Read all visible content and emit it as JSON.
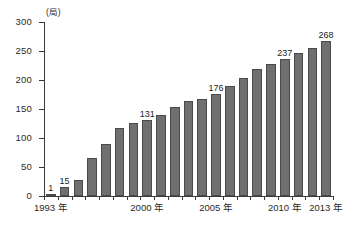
{
  "chart_data": {
    "type": "bar",
    "title": "",
    "subtitle": "",
    "xlabel": "",
    "ylabel": "(局)",
    "yunit": "(局)",
    "ylim": [
      0,
      300
    ],
    "ytick_labels": [
      "300",
      "250",
      "200",
      "150",
      "100",
      "50",
      "0"
    ],
    "ytick_values": [
      300,
      250,
      200,
      150,
      100,
      50,
      0
    ],
    "grid": false,
    "legend": null,
    "bar_color": "#6f6f6f",
    "bar_edge_color": "#4a4a4a",
    "axis_color": "#3a3a3a",
    "categories": [
      "1993",
      "1994",
      "1995",
      "1996",
      "1997",
      "1998",
      "1999",
      "2000",
      "2001",
      "2002",
      "2003",
      "2004",
      "2005",
      "2006",
      "2007",
      "2008",
      "2009",
      "2010",
      "2011",
      "2012",
      "2013"
    ],
    "values": [
      1,
      15,
      28,
      65,
      90,
      118,
      126,
      131,
      140,
      153,
      163,
      167,
      176,
      189,
      203,
      219,
      228,
      237,
      247,
      256,
      268
    ],
    "point_labels": [
      "1",
      "15",
      "",
      "",
      "",
      "",
      "",
      "131",
      "",
      "",
      "",
      "",
      "176",
      "",
      "",
      "",
      "",
      "237",
      "",
      "",
      "268"
    ],
    "xtick_labels": [
      "1993 年",
      "2000 年",
      "2005 年",
      "2010 年",
      "2013 年"
    ],
    "xtick_categories": [
      "1993",
      "2000",
      "2005",
      "2010",
      "2013"
    ]
  }
}
